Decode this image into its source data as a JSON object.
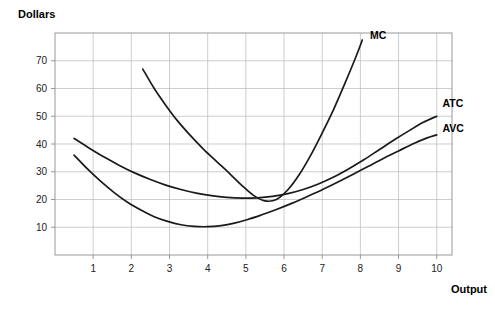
{
  "chart_data": {
    "type": "line",
    "title": "",
    "xlabel": "Output",
    "ylabel": "Dollars",
    "xlim": [
      0,
      10.4
    ],
    "ylim": [
      0,
      80
    ],
    "grid": true,
    "legend_position": "inline-right-of-curve-ends",
    "x_ticks": [
      1,
      2,
      3,
      4,
      5,
      6,
      7,
      8,
      9,
      10
    ],
    "y_ticks": [
      10,
      20,
      30,
      40,
      50,
      60,
      70
    ],
    "series": [
      {
        "name": "MC",
        "label": "MC",
        "color": "#1a1a1a",
        "points": [
          [
            2.3,
            67.0
          ],
          [
            2.6,
            60.0
          ],
          [
            2.9,
            54.0
          ],
          [
            3.2,
            48.5
          ],
          [
            3.55,
            43.0
          ],
          [
            3.9,
            38.0
          ],
          [
            4.25,
            33.5
          ],
          [
            4.6,
            29.0
          ],
          [
            4.9,
            25.0
          ],
          [
            5.2,
            21.5
          ],
          [
            5.5,
            19.5
          ],
          [
            5.8,
            20.0
          ],
          [
            6.1,
            23.5
          ],
          [
            6.4,
            29.0
          ],
          [
            6.7,
            36.0
          ],
          [
            7.0,
            44.0
          ],
          [
            7.3,
            52.5
          ],
          [
            7.6,
            62.0
          ],
          [
            7.9,
            72.0
          ],
          [
            8.05,
            77.5
          ]
        ]
      },
      {
        "name": "ATC",
        "label": "ATC",
        "color": "#1a1a1a",
        "points": [
          [
            0.5,
            42.0
          ],
          [
            0.9,
            38.5
          ],
          [
            1.3,
            35.2
          ],
          [
            1.7,
            32.2
          ],
          [
            2.1,
            29.5
          ],
          [
            2.5,
            27.2
          ],
          [
            2.9,
            25.2
          ],
          [
            3.3,
            23.6
          ],
          [
            3.7,
            22.3
          ],
          [
            4.1,
            21.4
          ],
          [
            4.5,
            20.8
          ],
          [
            4.9,
            20.5
          ],
          [
            5.3,
            20.6
          ],
          [
            5.7,
            21.1
          ],
          [
            6.1,
            22.1
          ],
          [
            6.5,
            23.6
          ],
          [
            6.9,
            25.6
          ],
          [
            7.3,
            28.1
          ],
          [
            7.7,
            31.1
          ],
          [
            8.1,
            34.4
          ],
          [
            8.5,
            38.0
          ],
          [
            8.9,
            41.6
          ],
          [
            9.3,
            45.0
          ],
          [
            9.65,
            47.8
          ],
          [
            10.0,
            50.0
          ]
        ]
      },
      {
        "name": "AVC",
        "label": "AVC",
        "color": "#1a1a1a",
        "points": [
          [
            0.5,
            36.0
          ],
          [
            0.85,
            31.0
          ],
          [
            1.2,
            26.5
          ],
          [
            1.55,
            22.5
          ],
          [
            1.9,
            19.0
          ],
          [
            2.25,
            16.2
          ],
          [
            2.6,
            13.8
          ],
          [
            2.95,
            12.1
          ],
          [
            3.3,
            10.9
          ],
          [
            3.65,
            10.3
          ],
          [
            4.0,
            10.2
          ],
          [
            4.35,
            10.6
          ],
          [
            4.7,
            11.5
          ],
          [
            5.05,
            12.8
          ],
          [
            5.4,
            14.4
          ],
          [
            5.8,
            16.4
          ],
          [
            6.2,
            18.6
          ],
          [
            6.6,
            21.0
          ],
          [
            7.0,
            23.5
          ],
          [
            7.4,
            26.2
          ],
          [
            7.8,
            29.0
          ],
          [
            8.2,
            31.9
          ],
          [
            8.6,
            34.8
          ],
          [
            9.0,
            37.5
          ],
          [
            9.4,
            40.2
          ],
          [
            9.75,
            42.2
          ],
          [
            10.0,
            43.3
          ]
        ]
      }
    ],
    "annotations": [
      {
        "name": "MC",
        "text": "MC",
        "x": 8.25,
        "y": 79.0
      },
      {
        "name": "ATC",
        "text": "ATC",
        "x": 10.15,
        "y": 54.5
      },
      {
        "name": "AVC",
        "text": "AVC",
        "x": 10.15,
        "y": 45.5
      }
    ]
  }
}
